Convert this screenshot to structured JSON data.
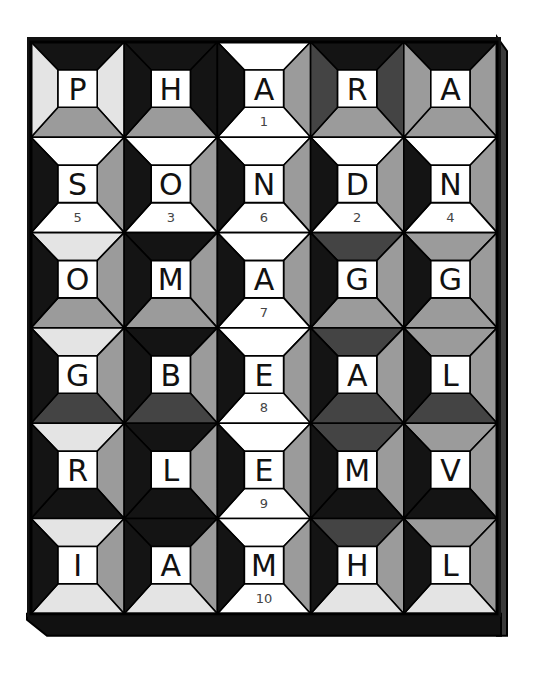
{
  "puzzle": {
    "rows": 6,
    "cols": 5,
    "palette": {
      "W": "#ffffff",
      "L": "#e4e4e4",
      "G": "#9b9b9b",
      "D": "#444444",
      "B": "#141414"
    },
    "frame_color": "#111111",
    "side_panel_color": "#3a3a3a",
    "cells": [
      [
        {
          "letter": "P",
          "number": "",
          "colors": [
            "B",
            "L",
            "G",
            "L"
          ]
        },
        {
          "letter": "H",
          "number": "",
          "colors": [
            "B",
            "B",
            "G",
            "B"
          ]
        },
        {
          "letter": "A",
          "number": "1",
          "colors": [
            "W",
            "G",
            "W",
            "B"
          ]
        },
        {
          "letter": "R",
          "number": "",
          "colors": [
            "B",
            "D",
            "G",
            "D"
          ]
        },
        {
          "letter": "A",
          "number": "",
          "colors": [
            "B",
            "G",
            "G",
            "G"
          ]
        }
      ],
      [
        {
          "letter": "S",
          "number": "5",
          "colors": [
            "W",
            "G",
            "W",
            "B"
          ]
        },
        {
          "letter": "O",
          "number": "3",
          "colors": [
            "W",
            "G",
            "W",
            "B"
          ]
        },
        {
          "letter": "N",
          "number": "6",
          "colors": [
            "W",
            "G",
            "W",
            "B"
          ]
        },
        {
          "letter": "D",
          "number": "2",
          "colors": [
            "W",
            "G",
            "W",
            "B"
          ]
        },
        {
          "letter": "N",
          "number": "4",
          "colors": [
            "W",
            "G",
            "W",
            "B"
          ]
        }
      ],
      [
        {
          "letter": "O",
          "number": "",
          "colors": [
            "L",
            "G",
            "G",
            "B"
          ]
        },
        {
          "letter": "M",
          "number": "",
          "colors": [
            "B",
            "G",
            "G",
            "B"
          ]
        },
        {
          "letter": "A",
          "number": "7",
          "colors": [
            "W",
            "G",
            "W",
            "B"
          ]
        },
        {
          "letter": "G",
          "number": "",
          "colors": [
            "D",
            "G",
            "G",
            "B"
          ]
        },
        {
          "letter": "G",
          "number": "",
          "colors": [
            "G",
            "G",
            "G",
            "B"
          ]
        }
      ],
      [
        {
          "letter": "G",
          "number": "",
          "colors": [
            "L",
            "G",
            "D",
            "B"
          ]
        },
        {
          "letter": "B",
          "number": "",
          "colors": [
            "B",
            "G",
            "D",
            "B"
          ]
        },
        {
          "letter": "E",
          "number": "8",
          "colors": [
            "W",
            "G",
            "W",
            "B"
          ]
        },
        {
          "letter": "A",
          "number": "",
          "colors": [
            "D",
            "G",
            "D",
            "B"
          ]
        },
        {
          "letter": "L",
          "number": "",
          "colors": [
            "G",
            "G",
            "D",
            "B"
          ]
        }
      ],
      [
        {
          "letter": "R",
          "number": "",
          "colors": [
            "L",
            "G",
            "B",
            "B"
          ]
        },
        {
          "letter": "L",
          "number": "",
          "colors": [
            "B",
            "G",
            "B",
            "B"
          ]
        },
        {
          "letter": "E",
          "number": "9",
          "colors": [
            "W",
            "G",
            "W",
            "B"
          ]
        },
        {
          "letter": "M",
          "number": "",
          "colors": [
            "D",
            "G",
            "B",
            "B"
          ]
        },
        {
          "letter": "V",
          "number": "",
          "colors": [
            "G",
            "G",
            "B",
            "B"
          ]
        }
      ],
      [
        {
          "letter": "I",
          "number": "",
          "colors": [
            "L",
            "G",
            "L",
            "B"
          ]
        },
        {
          "letter": "A",
          "number": "",
          "colors": [
            "B",
            "G",
            "L",
            "B"
          ]
        },
        {
          "letter": "M",
          "number": "10",
          "colors": [
            "W",
            "G",
            "W",
            "B"
          ]
        },
        {
          "letter": "H",
          "number": "",
          "colors": [
            "D",
            "G",
            "L",
            "B"
          ]
        },
        {
          "letter": "L",
          "number": "",
          "colors": [
            "G",
            "G",
            "L",
            "B"
          ]
        }
      ]
    ]
  }
}
